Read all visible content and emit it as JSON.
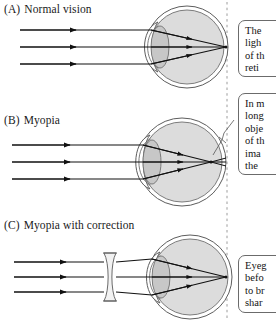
{
  "figure": {
    "width": 276,
    "height": 320,
    "background_color": "#ffffff",
    "ink_color": "#1a1a1a",
    "eye_fill_color": "#d9d9d9",
    "lens_fill_color": "#c4c4c4",
    "dashed_line_color": "#9a9a9a"
  },
  "panels": [
    {
      "id": "panel-a",
      "tag": "(A)",
      "label": "Normal vision",
      "ray_count": 3,
      "has_corrective_lens": false,
      "focus_location": "on the retina"
    },
    {
      "id": "panel-b",
      "tag": "(B)",
      "label": "Myopia",
      "ray_count": 3,
      "has_corrective_lens": false,
      "focus_location": "in front of the retina"
    },
    {
      "id": "panel-c",
      "tag": "(C)",
      "label": "Myopia with correction",
      "ray_count": 3,
      "has_corrective_lens": true,
      "focus_location": "on the retina"
    }
  ],
  "callouts": [
    {
      "id": "callout-normal",
      "lines": [
        "The",
        "ligh",
        "of th",
        "reti"
      ]
    },
    {
      "id": "callout-myopia",
      "lines": [
        "In m",
        "long",
        "obje",
        "of th",
        "ima",
        "the"
      ]
    },
    {
      "id": "callout-correction",
      "lines": [
        "Eyeg",
        "befo",
        "to br",
        "shar"
      ]
    }
  ]
}
